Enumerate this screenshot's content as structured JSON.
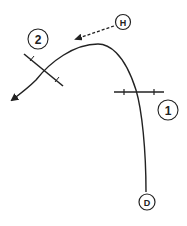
{
  "diagram": {
    "labels": {
      "h": "H",
      "d": "D",
      "one": "1",
      "two": "2"
    },
    "colors": {
      "stroke": "#222222",
      "background": "#ffffff"
    },
    "elements": [
      {
        "id": "h-node",
        "label": "H",
        "type": "circle-label"
      },
      {
        "id": "d-node",
        "label": "D",
        "type": "circle-label"
      },
      {
        "id": "marker-1",
        "label": "1",
        "type": "circle-label"
      },
      {
        "id": "marker-2",
        "label": "2",
        "type": "circle-label"
      },
      {
        "id": "trajectory",
        "type": "curve-with-arrow"
      },
      {
        "id": "h-arrow",
        "type": "dashed-arrow"
      },
      {
        "id": "cross-section-1",
        "type": "tick-line"
      },
      {
        "id": "cross-section-2",
        "type": "tick-line"
      }
    ]
  }
}
